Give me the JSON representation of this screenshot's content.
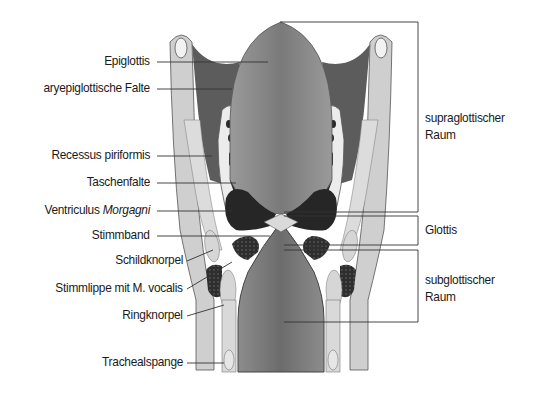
{
  "figure": {
    "left_labels": [
      {
        "id": "epiglottis",
        "text": "Epiglottis"
      },
      {
        "id": "aryepiglottische-falte",
        "text": "aryepiglottische Falte"
      },
      {
        "id": "recessus-piriformis",
        "text": "Recessus piriformis"
      },
      {
        "id": "taschenfalte",
        "text": "Taschenfalte"
      },
      {
        "id": "ventriculus",
        "text": "Ventriculus ",
        "italic": "Morgagni"
      },
      {
        "id": "stimmband",
        "text": "Stimmband"
      },
      {
        "id": "schildknorpel",
        "text": "Schildknorpel"
      },
      {
        "id": "stimmlippe",
        "text": "Stimmlippe mit M. vocalis"
      },
      {
        "id": "ringknorpel",
        "text": "Ringknorpel"
      },
      {
        "id": "trachealspange",
        "text": "Trachealspange"
      }
    ],
    "right_labels": [
      {
        "id": "supraglottischer-raum",
        "line1": "supraglottischer",
        "line2": "Raum"
      },
      {
        "id": "glottis",
        "line1": "Glottis"
      },
      {
        "id": "subglottischer-raum",
        "line1": "subglottischer",
        "line2": "Raum"
      }
    ],
    "colors": {
      "lumen_dark": "#6e6e6e",
      "lumen_mid": "#8a8a8a",
      "fold_dark": "#5a5a5a",
      "cartilage_light": "#c8c8c8",
      "tissue_pale": "#e2e2e2",
      "muscle_black": "#2a2a2a",
      "line": "#333333"
    }
  }
}
